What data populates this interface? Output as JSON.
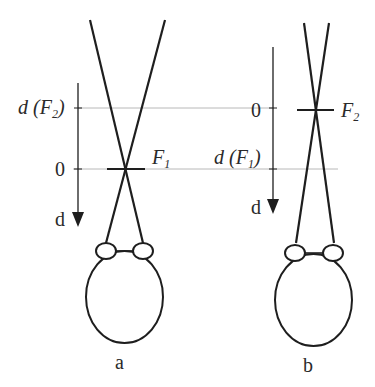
{
  "colors": {
    "stroke": "#1e1e1e",
    "guide": "#b8b8b8",
    "text": "#2a2a2a",
    "background": "#ffffff"
  },
  "panels": [
    {
      "id": "a",
      "caption": "a",
      "axis_label": "d",
      "zero_label": "0",
      "distance_label_prefix": "d (F",
      "distance_label_sub": "2",
      "distance_label_suffix": ")",
      "focus_label": "F",
      "focus_sub": "1"
    },
    {
      "id": "b",
      "caption": "b",
      "axis_label": "d",
      "zero_label": "0",
      "distance_label_prefix": "d (F",
      "distance_label_sub": "1",
      "distance_label_suffix": ")",
      "focus_label": "F",
      "focus_sub": "2"
    }
  ]
}
